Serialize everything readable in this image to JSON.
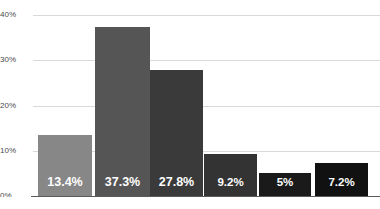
{
  "chart_data": {
    "type": "bar",
    "title": "",
    "subtitle": "",
    "xlabel": "",
    "ylabel": "",
    "categories": [
      "",
      "",
      "",
      "",
      "",
      ""
    ],
    "values": [
      13.4,
      37.3,
      27.8,
      9.2,
      5,
      7.2
    ],
    "data_labels": [
      "13.4%",
      "37.3%",
      "27.8%",
      "9.2%",
      "5%",
      "7.2%"
    ],
    "bar_colors": [
      "#878787",
      "#555555",
      "#3a3a3a",
      "#333333",
      "#1a1a1a",
      "#111111"
    ],
    "data_label_color": "#ffffff",
    "ylim": [
      0,
      40
    ],
    "yticks": [
      0,
      10,
      20,
      30,
      40
    ],
    "ytick_labels": [
      "0%",
      "10%",
      "20%",
      "30%",
      "40%"
    ],
    "grid": true,
    "gridline_color": "#d9d9d9",
    "axis_color": "#5a5a5a",
    "legend": null,
    "legend_position": "none",
    "background": "#ffffff"
  },
  "geometry": {
    "bars": [
      {
        "left": 38,
        "width": 54
      },
      {
        "left": 95,
        "width": 55
      },
      {
        "left": 150,
        "width": 53
      },
      {
        "left": 204,
        "width": 53
      },
      {
        "left": 259,
        "width": 52
      },
      {
        "left": 315,
        "width": 53
      }
    ],
    "baseline_y": 196,
    "top_y": 15,
    "pixels_per_unit": 4.525
  }
}
